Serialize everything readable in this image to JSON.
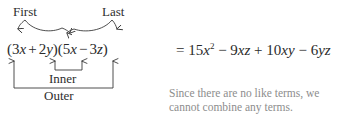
{
  "diagram": {
    "labels": {
      "first": "First",
      "last": "Last",
      "inner": "Inner",
      "outer": "Outer"
    },
    "binomial": {
      "open1": "(",
      "term1_coeff": "3",
      "term1_var": "x",
      "op1": "+",
      "term2_coeff": "2",
      "term2_var": "y",
      "close1": ")",
      "open2": "(",
      "term3_coeff": "5",
      "term3_var": "x",
      "op2": "−",
      "term4_coeff": "3",
      "term4_var": "z",
      "close2": ")",
      "full_text": "(3x + 2y)(5x − 3z)"
    },
    "result": {
      "equals": "=",
      "term1_coeff": "15",
      "term1_var": "x",
      "term1_exp": "2",
      "op1": "−",
      "term2_coeff": "9",
      "term2_var": "xz",
      "op2": "+",
      "term3_coeff": "10",
      "term3_var": "xy",
      "op3": "−",
      "term4_coeff": "6",
      "term4_var": "yz",
      "full_text": "= 15x² − 9xz + 10xy − 6yz"
    },
    "note": {
      "line1": "Since there are no like terms, we",
      "line2": "cannot combine any terms."
    },
    "colors": {
      "text": "#2b2b2b",
      "note_text": "#8d8d8d",
      "stroke": "#3a3a3a",
      "background": "#ffffff"
    }
  }
}
